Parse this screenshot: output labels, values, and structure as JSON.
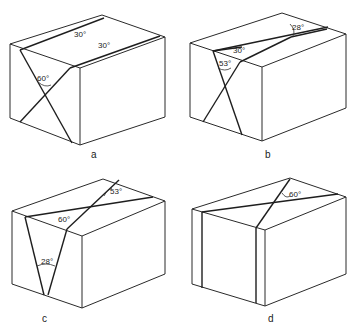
{
  "panels": [
    {
      "id": "a",
      "caption": "a",
      "angles": [
        "30°",
        "30°",
        "60°"
      ]
    },
    {
      "id": "b",
      "caption": "b",
      "angles": [
        "28°",
        "30°",
        "53°"
      ]
    },
    {
      "id": "c",
      "caption": "c",
      "angles": [
        "53°",
        "60°",
        "28°"
      ]
    },
    {
      "id": "d",
      "caption": "d",
      "angles": [
        "60°"
      ]
    }
  ]
}
